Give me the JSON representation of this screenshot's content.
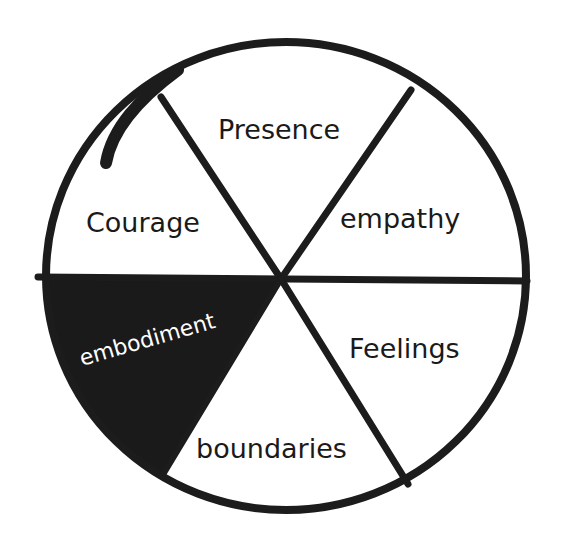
{
  "diagram": {
    "type": "segmented-wheel",
    "segment_count": 6,
    "colors": {
      "ink": "#1c1c1c",
      "background": "#ffffff",
      "highlight_fill": "#1a1a1a",
      "highlight_text": "#ffffff"
    },
    "segments": [
      {
        "id": "presence",
        "label": "Presence",
        "position": "top",
        "highlighted": false
      },
      {
        "id": "empathy",
        "label": "empathy",
        "position": "upper-right",
        "highlighted": false
      },
      {
        "id": "feelings",
        "label": "Feelings",
        "position": "lower-right",
        "highlighted": false
      },
      {
        "id": "boundaries",
        "label": "boundaries",
        "position": "bottom",
        "highlighted": false
      },
      {
        "id": "embodiment",
        "label": "embodiment",
        "position": "lower-left",
        "highlighted": true
      },
      {
        "id": "courage",
        "label": "Courage",
        "position": "upper-left",
        "highlighted": false
      }
    ]
  }
}
